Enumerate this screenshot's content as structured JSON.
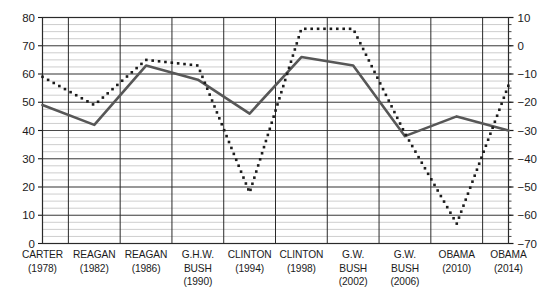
{
  "chart_data": {
    "type": "line",
    "title": "",
    "subtitle": "",
    "xlabel": "",
    "ylabel": "",
    "grid": true,
    "legend_position": "none",
    "categories": [
      "CARTER",
      "REAGAN",
      "REAGAN",
      "G.H.W. BUSH",
      "CLINTON",
      "CLINTON",
      "G.W. BUSH",
      "G.W. BUSH",
      "OBAMA",
      "OBAMA"
    ],
    "category_lines": [
      [
        "CARTER",
        "(1978)"
      ],
      [
        "REAGAN",
        "(1982)"
      ],
      [
        "REAGAN",
        "(1986)"
      ],
      [
        "G.H.W.",
        "BUSH",
        "(1990)"
      ],
      [
        "CLINTON",
        "(1994)"
      ],
      [
        "CLINTON",
        "(1998)"
      ],
      [
        "G.W.",
        "BUSH",
        "(2002)"
      ],
      [
        "G.W.",
        "BUSH",
        "(2006)"
      ],
      [
        "OBAMA",
        "(2010)"
      ],
      [
        "OBAMA",
        "(2014)"
      ]
    ],
    "years": [
      1978,
      1982,
      1986,
      1990,
      1994,
      1998,
      2002,
      2006,
      2010,
      2014
    ],
    "left_axis": {
      "min": 0,
      "max": 80,
      "tick_step": 10,
      "ticks": [
        0,
        10,
        20,
        30,
        40,
        50,
        60,
        70,
        80
      ],
      "tick_labels": [
        "0",
        "10",
        "20",
        "30",
        "40",
        "50",
        "60",
        "70",
        "80"
      ],
      "minor_step": 2.5
    },
    "right_axis": {
      "min": -70,
      "max": 10,
      "tick_step": 10,
      "ticks": [
        -70,
        -60,
        -50,
        -40,
        -30,
        -20,
        -10,
        0,
        10
      ],
      "tick_labels": [
        "−70",
        "−60",
        "−50",
        "−40",
        "−30",
        "−20",
        "−10",
        "0",
        "10"
      ],
      "minor_step": 2.5
    },
    "series": [
      {
        "name": "solid-series",
        "style": "solid",
        "axis": "left",
        "color": "#575757",
        "values": [
          49,
          42,
          63,
          58,
          46,
          66,
          63,
          38,
          45,
          40
        ]
      },
      {
        "name": "dotted-series",
        "style": "dotted",
        "axis": "right",
        "color": "#1b1b1b",
        "values": [
          -11,
          -21,
          -5,
          -7,
          -52,
          6,
          6,
          -31,
          -63,
          -14
        ],
        "left_scale_equivalent": [
          59,
          49,
          65,
          63,
          18,
          75,
          75,
          39,
          7,
          56
        ]
      }
    ]
  }
}
